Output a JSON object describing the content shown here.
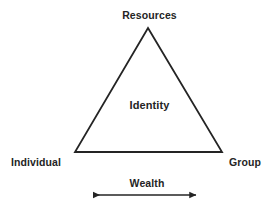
{
  "diagram": {
    "type": "triangle-diagram",
    "background_color": "#ffffff",
    "stroke_color": "#242424",
    "text_color": "#242424",
    "apex_label": "Resources",
    "center_label": "Identity",
    "bottom_left_label": "Individual",
    "bottom_right_label": "Group",
    "axis_label": "Wealth",
    "axis_arrow": "double-headed-arrow",
    "geometry": {
      "apex": [
        148,
        28
      ],
      "bottom_left": [
        75,
        152
      ],
      "bottom_right": [
        222,
        152
      ],
      "arrow_start": [
        91,
        195
      ],
      "arrow_end": [
        198,
        195
      ]
    }
  }
}
